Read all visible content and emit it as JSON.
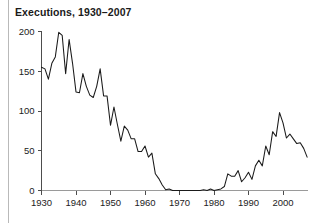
{
  "figure": {
    "title": "Executions, 1930–2007",
    "background_color": "#ffffff",
    "line_color": "#1a1a1a",
    "axis_color": "#4d4d4d",
    "rule_color": "#b9b9b9"
  },
  "axes": {
    "y_ticks": [
      "0",
      "50",
      "100",
      "150",
      "200"
    ],
    "x_ticks": [
      "1930",
      "1940",
      "1950",
      "1960",
      "1970",
      "1980",
      "1990",
      "2000"
    ]
  },
  "chart_data": {
    "type": "line",
    "title": "Executions, 1930–2007",
    "xlabel": "",
    "ylabel": "",
    "xlim": [
      1930,
      2007
    ],
    "ylim": [
      0,
      200
    ],
    "grid": false,
    "legend": null,
    "x_tick_labels": [
      "1930",
      "1940",
      "1950",
      "1960",
      "1970",
      "1980",
      "1990",
      "2000"
    ],
    "x_tick_values": [
      1930,
      1940,
      1950,
      1960,
      1970,
      1980,
      1990,
      2000
    ],
    "y_tick_labels": [
      "0",
      "50",
      "100",
      "150",
      "200"
    ],
    "y_tick_values": [
      0,
      50,
      100,
      150,
      200
    ],
    "x": [
      1930,
      1931,
      1932,
      1933,
      1934,
      1935,
      1936,
      1937,
      1938,
      1939,
      1940,
      1941,
      1942,
      1943,
      1944,
      1945,
      1946,
      1947,
      1948,
      1949,
      1950,
      1951,
      1952,
      1953,
      1954,
      1955,
      1956,
      1957,
      1958,
      1959,
      1960,
      1961,
      1962,
      1963,
      1964,
      1965,
      1966,
      1967,
      1968,
      1969,
      1970,
      1971,
      1972,
      1973,
      1974,
      1975,
      1976,
      1977,
      1978,
      1979,
      1980,
      1981,
      1982,
      1983,
      1984,
      1985,
      1986,
      1987,
      1988,
      1989,
      1990,
      1991,
      1992,
      1993,
      1994,
      1995,
      1996,
      1997,
      1998,
      1999,
      2000,
      2001,
      2002,
      2003,
      2004,
      2005,
      2006,
      2007
    ],
    "values": [
      155,
      153,
      140,
      160,
      168,
      199,
      195,
      147,
      190,
      160,
      124,
      123,
      147,
      131,
      120,
      117,
      131,
      153,
      119,
      119,
      82,
      105,
      83,
      62,
      81,
      76,
      65,
      65,
      49,
      49,
      56,
      42,
      47,
      21,
      15,
      7,
      1,
      2,
      0,
      0,
      0,
      0,
      0,
      0,
      0,
      0,
      0,
      1,
      0,
      2,
      0,
      1,
      2,
      5,
      21,
      18,
      18,
      25,
      11,
      16,
      23,
      14,
      31,
      38,
      31,
      56,
      45,
      74,
      68,
      98,
      85,
      66,
      71,
      65,
      59,
      60,
      53,
      42
    ],
    "series": [
      {
        "name": "Executions",
        "values": [
          155,
          153,
          140,
          160,
          168,
          199,
          195,
          147,
          190,
          160,
          124,
          123,
          147,
          131,
          120,
          117,
          131,
          153,
          119,
          119,
          82,
          105,
          83,
          62,
          81,
          76,
          65,
          65,
          49,
          49,
          56,
          42,
          47,
          21,
          15,
          7,
          1,
          2,
          0,
          0,
          0,
          0,
          0,
          0,
          0,
          0,
          0,
          1,
          0,
          2,
          0,
          1,
          2,
          5,
          21,
          18,
          18,
          25,
          11,
          16,
          23,
          14,
          31,
          38,
          31,
          56,
          45,
          74,
          68,
          98,
          85,
          66,
          71,
          65,
          59,
          60,
          53,
          42
        ]
      }
    ]
  }
}
